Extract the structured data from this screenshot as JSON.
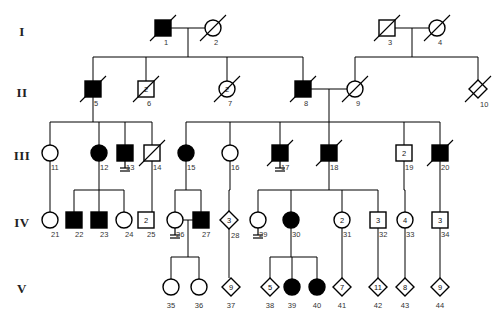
{
  "figure": {
    "type": "pedigree-chart",
    "width": 499,
    "height": 322,
    "background": "#ffffff",
    "line_color": "#000000",
    "affected_fill": "#000000",
    "unaffected_fill": "#ffffff"
  },
  "generation_labels": [
    {
      "label": "I",
      "y": 31
    },
    {
      "label": "II",
      "y": 92
    },
    {
      "label": "III",
      "y": 155
    },
    {
      "label": "IV",
      "y": 222
    },
    {
      "label": "V",
      "y": 288
    }
  ],
  "legend_symbols": {
    "square": "male",
    "circle": "female",
    "diamond": "unknown-sex",
    "filled": "affected",
    "open": "unaffected",
    "slash": "deceased",
    "number_inside": "multiple-siblings-count",
    "double-line-below": "no-offspring"
  },
  "individuals": [
    {
      "id": "1",
      "num": "1",
      "gen": "I",
      "shape": "square",
      "affected": true,
      "deceased": true,
      "x": 163,
      "y": 28,
      "count": null,
      "no_offspring": false
    },
    {
      "id": "2",
      "num": "2",
      "gen": "I",
      "shape": "circle",
      "affected": false,
      "deceased": true,
      "x": 213,
      "y": 28,
      "count": null,
      "no_offspring": false
    },
    {
      "id": "3",
      "num": "3",
      "gen": "I",
      "shape": "square",
      "affected": false,
      "deceased": true,
      "x": 387,
      "y": 28,
      "count": null,
      "no_offspring": false
    },
    {
      "id": "4",
      "num": "4",
      "gen": "I",
      "shape": "circle",
      "affected": false,
      "deceased": true,
      "x": 437,
      "y": 28,
      "count": null,
      "no_offspring": false
    },
    {
      "id": "5",
      "num": "5",
      "gen": "II",
      "shape": "square",
      "affected": true,
      "deceased": true,
      "x": 93,
      "y": 89,
      "count": null,
      "no_offspring": false
    },
    {
      "id": "6",
      "num": "6",
      "gen": "II",
      "shape": "square",
      "affected": false,
      "deceased": true,
      "x": 146,
      "y": 89,
      "count": "2",
      "no_offspring": false
    },
    {
      "id": "7",
      "num": "7",
      "gen": "II",
      "shape": "circle",
      "affected": false,
      "deceased": true,
      "x": 227,
      "y": 89,
      "count": "2",
      "no_offspring": false
    },
    {
      "id": "8",
      "num": "8",
      "gen": "II",
      "shape": "square",
      "affected": true,
      "deceased": true,
      "x": 303,
      "y": 89,
      "count": null,
      "no_offspring": false
    },
    {
      "id": "9",
      "num": "9",
      "gen": "II",
      "shape": "circle",
      "affected": false,
      "deceased": true,
      "x": 355,
      "y": 89,
      "count": null,
      "no_offspring": false
    },
    {
      "id": "10",
      "num": "10",
      "gen": "II",
      "shape": "diamond",
      "affected": false,
      "deceased": true,
      "x": 478,
      "y": 89,
      "count": null,
      "no_offspring": false
    },
    {
      "id": "11",
      "num": "11",
      "gen": "III",
      "shape": "circle",
      "affected": false,
      "deceased": false,
      "x": 50,
      "y": 153,
      "count": null,
      "no_offspring": false
    },
    {
      "id": "12",
      "num": "12",
      "gen": "III",
      "shape": "circle",
      "affected": true,
      "deceased": false,
      "x": 99,
      "y": 153,
      "count": null,
      "no_offspring": false
    },
    {
      "id": "13",
      "num": "13",
      "gen": "III",
      "shape": "square",
      "affected": true,
      "deceased": false,
      "x": 125,
      "y": 153,
      "count": null,
      "no_offspring": true
    },
    {
      "id": "14",
      "num": "14",
      "gen": "III",
      "shape": "square",
      "affected": false,
      "deceased": true,
      "x": 152,
      "y": 153,
      "count": null,
      "no_offspring": false
    },
    {
      "id": "15",
      "num": "15",
      "gen": "III",
      "shape": "circle",
      "affected": true,
      "deceased": false,
      "x": 186,
      "y": 153,
      "count": null,
      "no_offspring": false
    },
    {
      "id": "16",
      "num": "16",
      "gen": "III",
      "shape": "circle",
      "affected": false,
      "deceased": false,
      "x": 230,
      "y": 153,
      "count": null,
      "no_offspring": false
    },
    {
      "id": "17",
      "num": "17",
      "gen": "III",
      "shape": "square",
      "affected": true,
      "deceased": true,
      "x": 280,
      "y": 153,
      "count": null,
      "no_offspring": true
    },
    {
      "id": "18",
      "num": "18",
      "gen": "III",
      "shape": "square",
      "affected": true,
      "deceased": true,
      "x": 329,
      "y": 153,
      "count": null,
      "no_offspring": false
    },
    {
      "id": "19",
      "num": "19",
      "gen": "III",
      "shape": "square",
      "affected": false,
      "deceased": false,
      "x": 404,
      "y": 153,
      "count": "2",
      "no_offspring": false
    },
    {
      "id": "20",
      "num": "20",
      "gen": "III",
      "shape": "square",
      "affected": true,
      "deceased": true,
      "x": 440,
      "y": 153,
      "count": null,
      "no_offspring": false
    },
    {
      "id": "21",
      "num": "21",
      "gen": "IV",
      "shape": "circle",
      "affected": false,
      "deceased": false,
      "x": 50,
      "y": 220,
      "count": null,
      "no_offspring": false
    },
    {
      "id": "22",
      "num": "22",
      "gen": "IV",
      "shape": "square",
      "affected": true,
      "deceased": false,
      "x": 74,
      "y": 220,
      "count": null,
      "no_offspring": false
    },
    {
      "id": "23",
      "num": "23",
      "gen": "IV",
      "shape": "square",
      "affected": true,
      "deceased": false,
      "x": 99,
      "y": 220,
      "count": null,
      "no_offspring": false
    },
    {
      "id": "24",
      "num": "24",
      "gen": "IV",
      "shape": "circle",
      "affected": false,
      "deceased": false,
      "x": 124,
      "y": 220,
      "count": null,
      "no_offspring": false
    },
    {
      "id": "25",
      "num": "25",
      "gen": "IV",
      "shape": "square",
      "affected": false,
      "deceased": false,
      "x": 146,
      "y": 220,
      "count": "2",
      "no_offspring": false
    },
    {
      "id": "26",
      "num": "26",
      "gen": "IV",
      "shape": "circle",
      "affected": false,
      "deceased": false,
      "x": 175,
      "y": 220,
      "count": null,
      "no_offspring": true
    },
    {
      "id": "27",
      "num": "27",
      "gen": "IV",
      "shape": "square",
      "affected": true,
      "deceased": false,
      "x": 201,
      "y": 220,
      "count": null,
      "no_offspring": false
    },
    {
      "id": "28",
      "num": "28",
      "gen": "IV",
      "shape": "diamond",
      "affected": false,
      "deceased": false,
      "x": 229,
      "y": 220,
      "count": "3",
      "no_offspring": false
    },
    {
      "id": "29",
      "num": "29",
      "gen": "IV",
      "shape": "circle",
      "affected": false,
      "deceased": false,
      "x": 258,
      "y": 220,
      "count": null,
      "no_offspring": true
    },
    {
      "id": "30",
      "num": "30",
      "gen": "IV",
      "shape": "circle",
      "affected": true,
      "deceased": false,
      "x": 291,
      "y": 220,
      "count": null,
      "no_offspring": false
    },
    {
      "id": "31",
      "num": "31",
      "gen": "IV",
      "shape": "circle",
      "affected": false,
      "deceased": false,
      "x": 342,
      "y": 220,
      "count": "2",
      "no_offspring": false
    },
    {
      "id": "32",
      "num": "32",
      "gen": "IV",
      "shape": "square",
      "affected": false,
      "deceased": false,
      "x": 378,
      "y": 220,
      "count": "3",
      "no_offspring": false
    },
    {
      "id": "33",
      "num": "33",
      "gen": "IV",
      "shape": "circle",
      "affected": false,
      "deceased": false,
      "x": 405,
      "y": 220,
      "count": "4",
      "no_offspring": false
    },
    {
      "id": "34",
      "num": "34",
      "gen": "IV",
      "shape": "square",
      "affected": false,
      "deceased": false,
      "x": 440,
      "y": 220,
      "count": "3",
      "no_offspring": false
    },
    {
      "id": "35",
      "num": "35",
      "gen": "V",
      "shape": "circle",
      "affected": false,
      "deceased": false,
      "x": 171,
      "y": 287,
      "count": null,
      "no_offspring": false
    },
    {
      "id": "36",
      "num": "36",
      "gen": "V",
      "shape": "circle",
      "affected": false,
      "deceased": false,
      "x": 199,
      "y": 287,
      "count": null,
      "no_offspring": false
    },
    {
      "id": "37",
      "num": "37",
      "gen": "V",
      "shape": "diamond",
      "affected": false,
      "deceased": false,
      "x": 231,
      "y": 287,
      "count": "9",
      "no_offspring": false
    },
    {
      "id": "38",
      "num": "38",
      "gen": "V",
      "shape": "diamond",
      "affected": false,
      "deceased": false,
      "x": 270,
      "y": 287,
      "count": "5",
      "no_offspring": false
    },
    {
      "id": "39",
      "num": "39",
      "gen": "V",
      "shape": "circle",
      "affected": true,
      "deceased": false,
      "x": 292,
      "y": 287,
      "count": null,
      "no_offspring": false
    },
    {
      "id": "40",
      "num": "40",
      "gen": "V",
      "shape": "circle",
      "affected": true,
      "deceased": false,
      "x": 317,
      "y": 287,
      "count": null,
      "no_offspring": false
    },
    {
      "id": "41",
      "num": "41",
      "gen": "V",
      "shape": "diamond",
      "affected": false,
      "deceased": false,
      "x": 342,
      "y": 287,
      "count": "7",
      "no_offspring": false
    },
    {
      "id": "42",
      "num": "42",
      "gen": "V",
      "shape": "diamond",
      "affected": false,
      "deceased": false,
      "x": 378,
      "y": 287,
      "count": "11",
      "no_offspring": false
    },
    {
      "id": "43",
      "num": "43",
      "gen": "V",
      "shape": "diamond",
      "affected": false,
      "deceased": false,
      "x": 405,
      "y": 287,
      "count": "8",
      "no_offspring": false
    },
    {
      "id": "44",
      "num": "44",
      "gen": "V",
      "shape": "diamond",
      "affected": false,
      "deceased": false,
      "x": 440,
      "y": 287,
      "count": "9",
      "no_offspring": false
    }
  ],
  "matings": [
    {
      "name": "mating-1-2",
      "partners": [
        "1",
        "2"
      ],
      "children": [
        "5",
        "6",
        "7",
        "8"
      ]
    },
    {
      "name": "mating-3-4",
      "partners": [
        "3",
        "4"
      ],
      "children": [
        "9",
        "10"
      ]
    },
    {
      "name": "mating-5",
      "partners": [
        "5"
      ],
      "children": [
        "11",
        "12",
        "13",
        "14"
      ]
    },
    {
      "name": "mating-8-9",
      "partners": [
        "8",
        "9"
      ],
      "children": [
        "15",
        "16",
        "17",
        "18",
        "19",
        "20"
      ]
    },
    {
      "name": "mating-12-13",
      "partners": [
        "12",
        "13"
      ],
      "children": [
        "22",
        "23",
        "24"
      ]
    },
    {
      "name": "mating-15",
      "partners": [
        "15"
      ],
      "children": [
        "26",
        "27"
      ]
    },
    {
      "name": "mating-18",
      "partners": [
        "18"
      ],
      "children": [
        "29",
        "30",
        "31",
        "32"
      ]
    },
    {
      "name": "mating-26-27",
      "partners": [
        "26",
        "27"
      ],
      "children": [
        "35",
        "36"
      ]
    },
    {
      "name": "mating-30",
      "partners": [
        "30"
      ],
      "children": [
        "38",
        "39",
        "40"
      ]
    }
  ]
}
